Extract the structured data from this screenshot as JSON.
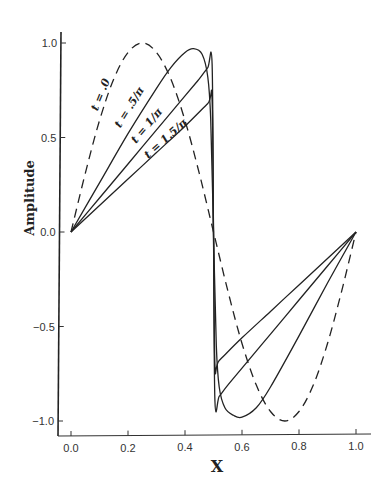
{
  "chart_data": {
    "type": "line",
    "title": "",
    "xlabel": "X",
    "ylabel": "Amplitude",
    "xlim": [
      0.0,
      1.0
    ],
    "ylim": [
      -1.0,
      1.0
    ],
    "grid": false,
    "legend_position": "inline labels along curves",
    "x_ticks": [
      "0.0",
      "0.2",
      "0.4",
      "0.6",
      "0.8",
      "1.0"
    ],
    "y_ticks": [
      "1.0",
      "0.5",
      "0.0",
      "-0.5",
      "-1.0"
    ],
    "series": [
      {
        "name": "t = .0",
        "style": "dashed",
        "x": [
          0.0,
          0.05,
          0.1,
          0.15,
          0.2,
          0.25,
          0.3,
          0.35,
          0.4,
          0.45,
          0.5,
          0.55,
          0.6,
          0.65,
          0.7,
          0.75,
          0.8,
          0.85,
          0.9,
          0.95,
          1.0
        ],
        "y": [
          0.0,
          0.31,
          0.59,
          0.81,
          0.95,
          1.0,
          0.95,
          0.81,
          0.59,
          0.31,
          0.0,
          -0.31,
          -0.59,
          -0.81,
          -0.95,
          -1.0,
          -0.95,
          -0.81,
          -0.59,
          -0.31,
          0.0
        ]
      },
      {
        "name": "t = .5/π",
        "style": "solid",
        "x": [
          0.0,
          0.1,
          0.2,
          0.3,
          0.35,
          0.4,
          0.43,
          0.46,
          0.48,
          0.49,
          0.5,
          0.51,
          0.52,
          0.54,
          0.57,
          0.6,
          0.65,
          0.7,
          0.8,
          0.9,
          1.0
        ],
        "y": [
          0.0,
          0.26,
          0.52,
          0.76,
          0.87,
          0.95,
          0.97,
          0.94,
          0.82,
          0.6,
          0.0,
          -0.6,
          -0.82,
          -0.93,
          -0.97,
          -0.98,
          -0.93,
          -0.82,
          -0.55,
          -0.27,
          0.0
        ]
      },
      {
        "name": "t = 1/π",
        "style": "solid",
        "x": [
          0.0,
          0.1,
          0.2,
          0.3,
          0.4,
          0.45,
          0.48,
          0.495,
          0.5,
          0.505,
          0.52,
          0.55,
          0.6,
          0.7,
          0.8,
          0.9,
          1.0
        ],
        "y": [
          0.0,
          0.18,
          0.36,
          0.54,
          0.72,
          0.81,
          0.87,
          0.89,
          0.0,
          -0.89,
          -0.87,
          -0.81,
          -0.72,
          -0.54,
          -0.36,
          -0.18,
          0.0
        ]
      },
      {
        "name": "t = 1.5/π",
        "style": "solid",
        "x": [
          0.0,
          0.1,
          0.2,
          0.3,
          0.4,
          0.48,
          0.495,
          0.5,
          0.505,
          0.52,
          0.6,
          0.7,
          0.8,
          0.9,
          1.0
        ],
        "y": [
          0.0,
          0.14,
          0.28,
          0.42,
          0.56,
          0.68,
          0.7,
          0.0,
          -0.7,
          -0.68,
          -0.56,
          -0.42,
          -0.28,
          -0.14,
          0.0
        ]
      }
    ],
    "annotations": [
      {
        "text": "t = .0",
        "x": 0.115,
        "y": 0.72,
        "rotation": -68
      },
      {
        "text": "t = .5/π",
        "x": 0.215,
        "y": 0.65,
        "rotation": -58
      },
      {
        "text": "t = 1/π",
        "x": 0.275,
        "y": 0.55,
        "rotation": -50
      },
      {
        "text": "t = 1.5/π",
        "x": 0.34,
        "y": 0.48,
        "rotation": -42
      }
    ]
  }
}
